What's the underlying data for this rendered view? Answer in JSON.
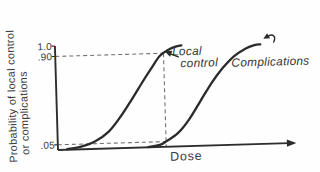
{
  "figure": {
    "y_axis_label_line1": "Probability of local control",
    "y_axis_label_line2": "or complications",
    "local_control_label_line1": "Local",
    "local_control_label_line2": "control",
    "complications_label": "Complications"
  },
  "chart_data": {
    "type": "line",
    "title": "",
    "xlabel": "Dose",
    "ylabel": "Probability of local control or complications",
    "ylim": [
      0,
      1.0
    ],
    "ytick_labels": [
      "1.0",
      ".90",
      ".05"
    ],
    "ytick_values": [
      1.0,
      0.9,
      0.05
    ],
    "xtick_labels": [],
    "grid": false,
    "legend_position": "inline labels with arrows on curves",
    "series": [
      {
        "name": "Local control",
        "x": [
          4,
          10,
          16,
          22,
          27,
          32,
          37,
          41,
          45,
          49,
          52,
          54.5
        ],
        "y": [
          0.005,
          0.025,
          0.07,
          0.16,
          0.29,
          0.45,
          0.62,
          0.75,
          0.875,
          0.935,
          0.96,
          0.97
        ]
      },
      {
        "name": "Complications",
        "x": [
          39,
          44,
          47,
          52,
          57,
          62,
          67,
          72,
          77,
          82,
          86,
          88.5
        ],
        "y": [
          0.003,
          0.02,
          0.055,
          0.13,
          0.26,
          0.43,
          0.6,
          0.74,
          0.85,
          0.92,
          0.952,
          0.958
        ]
      }
    ],
    "annotations": {
      "dashed_h_lines": [
        0.9,
        0.05
      ],
      "dashed_v_line_dose": 46.7
    }
  }
}
